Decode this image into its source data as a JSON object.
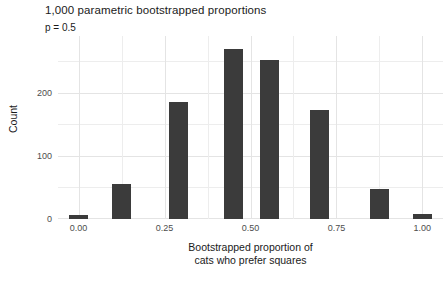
{
  "chart_data": {
    "type": "bar",
    "title": "1,000 parametric bootstrapped proportions",
    "subtitle": "p = 0.5",
    "xlabel_line1": "Bootstrapped proportion of",
    "xlabel_line2": "cats who prefer squares",
    "ylabel": "Count",
    "xlim": [
      -0.06,
      1.06
    ],
    "ylim": [
      0,
      290
    ],
    "xticks": [
      0.0,
      0.25,
      0.5,
      0.75,
      1.0
    ],
    "xtick_labels": [
      "0.00",
      "0.25",
      "0.50",
      "0.75",
      "1.00"
    ],
    "yticks": [
      0,
      100,
      200
    ],
    "ytick_labels": [
      "0",
      "100",
      "200"
    ],
    "y_minor_gridlines": [
      50,
      150,
      250
    ],
    "grid": true,
    "legend": "none",
    "bar_color": "#3b3b3b",
    "panel_color": "#ffffff",
    "grid_color": "#ededed",
    "bar_width": 0.055,
    "x": [
      0.0,
      0.125,
      0.29,
      0.45,
      0.555,
      0.7,
      0.875,
      1.0
    ],
    "values": [
      7,
      55,
      185,
      270,
      252,
      172,
      47,
      8
    ],
    "bars": [
      {
        "x": 0.0,
        "value": 7
      },
      {
        "x": 0.125,
        "value": 55
      },
      {
        "x": 0.29,
        "value": 185
      },
      {
        "x": 0.45,
        "value": 270
      },
      {
        "x": 0.555,
        "value": 252
      },
      {
        "x": 0.7,
        "value": 172
      },
      {
        "x": 0.875,
        "value": 47
      },
      {
        "x": 1.0,
        "value": 8
      }
    ]
  }
}
